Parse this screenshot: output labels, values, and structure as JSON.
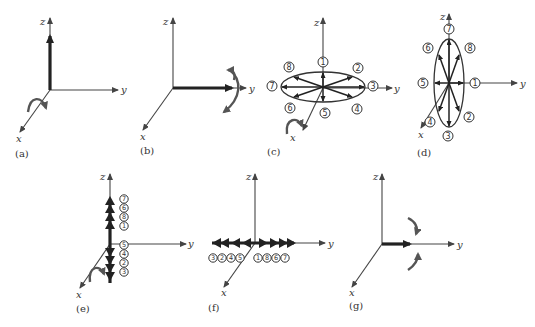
{
  "figure": {
    "panels": [
      {
        "id": "a",
        "caption": "(a)",
        "axes": {
          "x": "x",
          "y": "y",
          "z": "z"
        },
        "description": "Thick vector along +z with rotation arrow about x axis"
      },
      {
        "id": "b",
        "caption": "(b)",
        "axes": {
          "x": "x",
          "y": "y",
          "z": "z"
        },
        "description": "Thick vector along +y with rotation arrow about y"
      },
      {
        "id": "c",
        "caption": "(c)",
        "axes": {
          "x": "x",
          "y": "y",
          "z": "z"
        },
        "description": "Horizontal ellipse with 8 vectors in x-y plane",
        "positions": [
          "1",
          "2",
          "3",
          "4",
          "5",
          "6",
          "7",
          "8"
        ]
      },
      {
        "id": "d",
        "caption": "(d)",
        "axes": {
          "x": "x",
          "y": "y",
          "z": "z"
        },
        "description": "Vertical ellipse with 8 vectors in y-z plane",
        "positions": [
          "7",
          "8",
          "1",
          "2",
          "3",
          "4",
          "5",
          "6"
        ]
      },
      {
        "id": "e",
        "caption": "(e)",
        "axes": {
          "x": "x",
          "y": "y",
          "z": "z"
        },
        "description": "Vectors stacked along z axis",
        "labels_top_to_bottom": [
          "7",
          "6",
          "8",
          "1",
          "5",
          "4",
          "2",
          "3"
        ]
      },
      {
        "id": "f",
        "caption": "(f)",
        "axes": {
          "x": "x",
          "y": "y",
          "z": "z"
        },
        "description": "Vectors stacked along y axis",
        "labels_left_to_right": [
          "3",
          "2",
          "4",
          "5",
          "1",
          "8",
          "6",
          "7"
        ]
      },
      {
        "id": "g",
        "caption": "(g)",
        "axes": {
          "x": "x",
          "y": "y",
          "z": "z"
        },
        "description": "Thick vector along +y with rotation arrows"
      }
    ]
  }
}
